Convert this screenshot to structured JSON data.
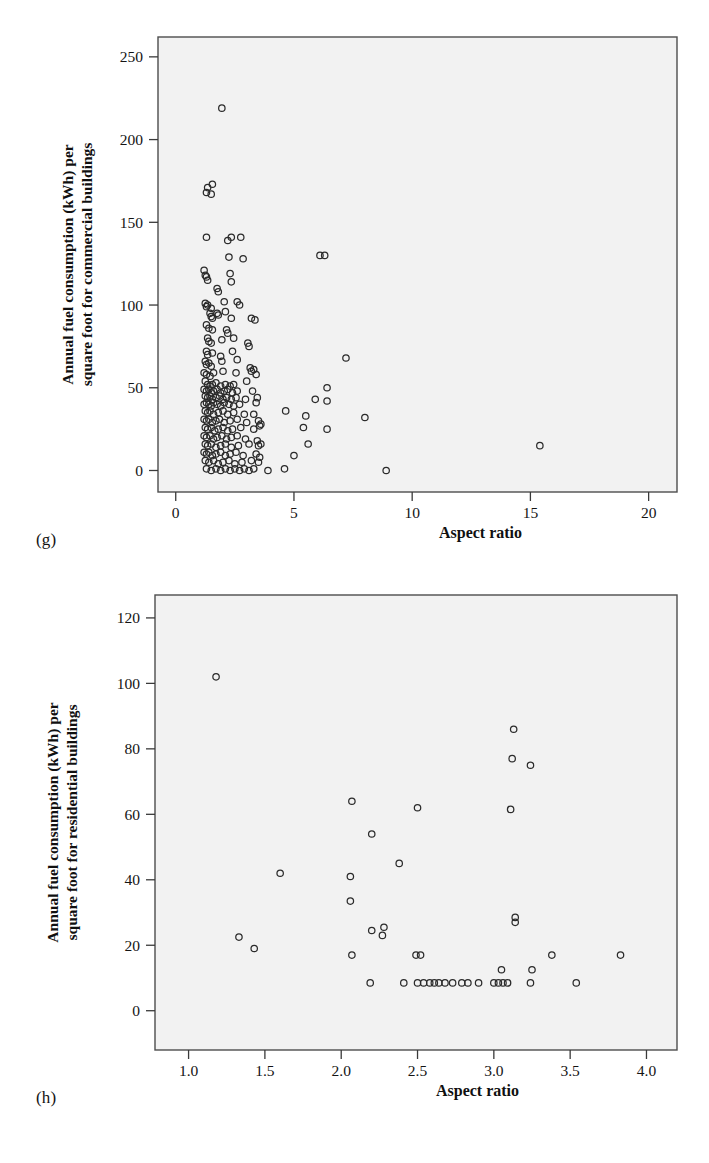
{
  "figure": {
    "panels": [
      {
        "id": "g",
        "panel_label": "(g)",
        "ylabel_line1": "Annual fuel consumption (kWh) per",
        "ylabel_line2": "square foot for commercial buildings",
        "xlabel": "Aspect ratio"
      },
      {
        "id": "h",
        "panel_label": "(h)",
        "ylabel_line1": "Annual fuel consumption (kWh) per",
        "ylabel_line2": "square foot for residential buildings",
        "xlabel": "Aspect ratio"
      }
    ]
  },
  "chart_data": [
    {
      "type": "scatter",
      "panel": "(g)",
      "title": "",
      "xlabel": "Aspect ratio",
      "ylabel": "Annual fuel consumption (kWh) per square foot for commercial buildings",
      "xlim": [
        -0.75,
        21.2
      ],
      "ylim": [
        -13,
        262
      ],
      "xticks": [
        0,
        5,
        10,
        15,
        20
      ],
      "xticklabels": [
        "0",
        "5",
        "10",
        "15",
        "20"
      ],
      "yticks": [
        0,
        50,
        100,
        150,
        200,
        250
      ],
      "yticklabels": [
        "0",
        "50",
        "100",
        "150",
        "200",
        "250"
      ],
      "grid": false,
      "legend": null,
      "marker": "open-circle",
      "points": [
        [
          1.95,
          219
        ],
        [
          1.35,
          171
        ],
        [
          1.3,
          168
        ],
        [
          1.55,
          173
        ],
        [
          1.5,
          167
        ],
        [
          1.3,
          141
        ],
        [
          2.2,
          139
        ],
        [
          2.35,
          141
        ],
        [
          2.75,
          141
        ],
        [
          2.25,
          129
        ],
        [
          2.85,
          128
        ],
        [
          6.1,
          130
        ],
        [
          6.3,
          130
        ],
        [
          1.2,
          121
        ],
        [
          1.25,
          118
        ],
        [
          1.3,
          117
        ],
        [
          1.35,
          115
        ],
        [
          2.3,
          119
        ],
        [
          2.35,
          114
        ],
        [
          1.75,
          110
        ],
        [
          1.8,
          108
        ],
        [
          1.25,
          101
        ],
        [
          1.3,
          99
        ],
        [
          1.35,
          100
        ],
        [
          1.5,
          98
        ],
        [
          2.05,
          102
        ],
        [
          2.6,
          102
        ],
        [
          2.7,
          100
        ],
        [
          1.45,
          95
        ],
        [
          1.5,
          93
        ],
        [
          1.55,
          92
        ],
        [
          1.75,
          95
        ],
        [
          1.8,
          94
        ],
        [
          2.1,
          96
        ],
        [
          2.35,
          92
        ],
        [
          3.2,
          92
        ],
        [
          3.35,
          91
        ],
        [
          1.3,
          88
        ],
        [
          1.4,
          86
        ],
        [
          1.55,
          85
        ],
        [
          2.15,
          85
        ],
        [
          2.2,
          83
        ],
        [
          1.35,
          80
        ],
        [
          1.4,
          78
        ],
        [
          1.5,
          77
        ],
        [
          1.95,
          79
        ],
        [
          2.45,
          80
        ],
        [
          3.05,
          77
        ],
        [
          3.1,
          75
        ],
        [
          1.3,
          72
        ],
        [
          1.35,
          70
        ],
        [
          1.55,
          71
        ],
        [
          1.9,
          69
        ],
        [
          2.4,
          72
        ],
        [
          7.2,
          68
        ],
        [
          1.25,
          66
        ],
        [
          1.3,
          64
        ],
        [
          1.4,
          65
        ],
        [
          1.5,
          63
        ],
        [
          1.95,
          66
        ],
        [
          2.6,
          67
        ],
        [
          3.15,
          62
        ],
        [
          3.2,
          60
        ],
        [
          1.2,
          59
        ],
        [
          1.3,
          58
        ],
        [
          1.45,
          57
        ],
        [
          1.6,
          59
        ],
        [
          2.0,
          60
        ],
        [
          2.55,
          59
        ],
        [
          3.3,
          61
        ],
        [
          3.4,
          58
        ],
        [
          1.25,
          54
        ],
        [
          1.35,
          52
        ],
        [
          1.45,
          51
        ],
        [
          1.55,
          52
        ],
        [
          1.7,
          53
        ],
        [
          1.9,
          51
        ],
        [
          2.1,
          52
        ],
        [
          2.3,
          51
        ],
        [
          2.45,
          52
        ],
        [
          3.0,
          54
        ],
        [
          6.4,
          50
        ],
        [
          1.2,
          49
        ],
        [
          1.3,
          48
        ],
        [
          1.4,
          49
        ],
        [
          1.5,
          47
        ],
        [
          1.6,
          48
        ],
        [
          1.75,
          49
        ],
        [
          1.9,
          47
        ],
        [
          2.05,
          48
        ],
        [
          2.2,
          49
        ],
        [
          2.4,
          47
        ],
        [
          2.6,
          48
        ],
        [
          3.25,
          48
        ],
        [
          1.25,
          45
        ],
        [
          1.35,
          44
        ],
        [
          1.45,
          45
        ],
        [
          1.55,
          43
        ],
        [
          1.7,
          44
        ],
        [
          1.85,
          45
        ],
        [
          2.0,
          43
        ],
        [
          2.15,
          44
        ],
        [
          2.35,
          43
        ],
        [
          2.55,
          44
        ],
        [
          2.95,
          43
        ],
        [
          3.45,
          44
        ],
        [
          5.9,
          43
        ],
        [
          6.4,
          42
        ],
        [
          1.2,
          40
        ],
        [
          1.3,
          41
        ],
        [
          1.4,
          40
        ],
        [
          1.5,
          39
        ],
        [
          1.6,
          41
        ],
        [
          1.75,
          40
        ],
        [
          1.9,
          39
        ],
        [
          2.05,
          41
        ],
        [
          2.25,
          40
        ],
        [
          2.45,
          39
        ],
        [
          2.7,
          40
        ],
        [
          3.4,
          41
        ],
        [
          4.65,
          36
        ],
        [
          1.25,
          36
        ],
        [
          1.35,
          35
        ],
        [
          1.45,
          36
        ],
        [
          1.6,
          34
        ],
        [
          1.8,
          35
        ],
        [
          2.0,
          36
        ],
        [
          2.2,
          34
        ],
        [
          2.45,
          35
        ],
        [
          2.9,
          34
        ],
        [
          3.3,
          34
        ],
        [
          5.5,
          33
        ],
        [
          8.0,
          32
        ],
        [
          1.2,
          31
        ],
        [
          1.3,
          30
        ],
        [
          1.4,
          31
        ],
        [
          1.55,
          29
        ],
        [
          1.7,
          30
        ],
        [
          1.85,
          31
        ],
        [
          2.05,
          29
        ],
        [
          2.3,
          30
        ],
        [
          2.6,
          31
        ],
        [
          3.0,
          29
        ],
        [
          3.5,
          30
        ],
        [
          3.6,
          28
        ],
        [
          1.25,
          26
        ],
        [
          1.35,
          25
        ],
        [
          1.5,
          26
        ],
        [
          1.65,
          24
        ],
        [
          1.8,
          25
        ],
        [
          2.0,
          26
        ],
        [
          2.2,
          24
        ],
        [
          2.4,
          25
        ],
        [
          2.75,
          26
        ],
        [
          3.3,
          25
        ],
        [
          3.55,
          27
        ],
        [
          5.4,
          26
        ],
        [
          6.4,
          25
        ],
        [
          1.2,
          21
        ],
        [
          1.3,
          20
        ],
        [
          1.45,
          21
        ],
        [
          1.6,
          19
        ],
        [
          1.75,
          20
        ],
        [
          1.95,
          21
        ],
        [
          2.15,
          19
        ],
        [
          2.35,
          20
        ],
        [
          2.6,
          21
        ],
        [
          2.95,
          19
        ],
        [
          3.45,
          18
        ],
        [
          3.6,
          16
        ],
        [
          1.25,
          16
        ],
        [
          1.35,
          15
        ],
        [
          1.5,
          16
        ],
        [
          1.7,
          14
        ],
        [
          1.9,
          15
        ],
        [
          2.1,
          16
        ],
        [
          2.35,
          14
        ],
        [
          2.65,
          15
        ],
        [
          3.1,
          16
        ],
        [
          3.5,
          15
        ],
        [
          5.6,
          16
        ],
        [
          15.4,
          15
        ],
        [
          1.2,
          11
        ],
        [
          1.3,
          10
        ],
        [
          1.4,
          11
        ],
        [
          1.55,
          9
        ],
        [
          1.7,
          10
        ],
        [
          1.9,
          11
        ],
        [
          2.1,
          9
        ],
        [
          2.3,
          10
        ],
        [
          2.55,
          11
        ],
        [
          2.85,
          9
        ],
        [
          3.4,
          10
        ],
        [
          3.55,
          8
        ],
        [
          5.0,
          9
        ],
        [
          1.25,
          6
        ],
        [
          1.4,
          5
        ],
        [
          1.6,
          6
        ],
        [
          1.8,
          4
        ],
        [
          2.0,
          5
        ],
        [
          2.25,
          6
        ],
        [
          2.5,
          4
        ],
        [
          2.8,
          5
        ],
        [
          3.2,
          6
        ],
        [
          3.5,
          5
        ],
        [
          1.3,
          1
        ],
        [
          1.5,
          0
        ],
        [
          1.7,
          1
        ],
        [
          1.9,
          0
        ],
        [
          2.1,
          1
        ],
        [
          2.3,
          0
        ],
        [
          2.5,
          1
        ],
        [
          2.7,
          0
        ],
        [
          2.9,
          1
        ],
        [
          3.1,
          0
        ],
        [
          3.3,
          1
        ],
        [
          3.9,
          0
        ],
        [
          4.6,
          1
        ],
        [
          8.9,
          0
        ]
      ]
    },
    {
      "type": "scatter",
      "panel": "(h)",
      "title": "",
      "xlabel": "Aspect ratio",
      "ylabel": "Annual fuel consumption (kWh) per square foot for residential buildings",
      "xlim": [
        0.78,
        4.2
      ],
      "ylim": [
        -12,
        127
      ],
      "xticks": [
        1.0,
        1.5,
        2.0,
        2.5,
        3.0,
        3.5,
        4.0
      ],
      "xticklabels": [
        "1.0",
        "1.5",
        "2.0",
        "2.5",
        "3.0",
        "3.5",
        "4.0"
      ],
      "yticks": [
        0,
        20,
        40,
        60,
        80,
        100,
        120
      ],
      "yticklabels": [
        "0",
        "20",
        "40",
        "60",
        "80",
        "100",
        "120"
      ],
      "grid": false,
      "legend": null,
      "marker": "open-circle",
      "points": [
        [
          1.18,
          102
        ],
        [
          3.13,
          86
        ],
        [
          3.12,
          77
        ],
        [
          3.24,
          75
        ],
        [
          2.07,
          64
        ],
        [
          2.5,
          62
        ],
        [
          3.11,
          61.5
        ],
        [
          2.2,
          54
        ],
        [
          2.38,
          45
        ],
        [
          1.6,
          42
        ],
        [
          2.06,
          41
        ],
        [
          2.06,
          33.5
        ],
        [
          3.14,
          28.5
        ],
        [
          3.14,
          27
        ],
        [
          2.2,
          24.5
        ],
        [
          2.28,
          25.5
        ],
        [
          2.27,
          23
        ],
        [
          1.33,
          22.5
        ],
        [
          1.43,
          19
        ],
        [
          2.07,
          17
        ],
        [
          2.49,
          17
        ],
        [
          2.52,
          17
        ],
        [
          3.38,
          17
        ],
        [
          3.83,
          17
        ],
        [
          3.05,
          12.5
        ],
        [
          3.25,
          12.5
        ],
        [
          2.19,
          8.5
        ],
        [
          2.41,
          8.5
        ],
        [
          2.5,
          8.5
        ],
        [
          2.54,
          8.5
        ],
        [
          2.58,
          8.5
        ],
        [
          2.61,
          8.5
        ],
        [
          2.64,
          8.5
        ],
        [
          2.68,
          8.5
        ],
        [
          2.73,
          8.5
        ],
        [
          2.79,
          8.5
        ],
        [
          2.83,
          8.5
        ],
        [
          2.9,
          8.5
        ],
        [
          3.0,
          8.5
        ],
        [
          3.03,
          8.5
        ],
        [
          3.06,
          8.5
        ],
        [
          3.09,
          8.5
        ],
        [
          3.24,
          8.5
        ],
        [
          3.54,
          8.5
        ]
      ]
    }
  ]
}
